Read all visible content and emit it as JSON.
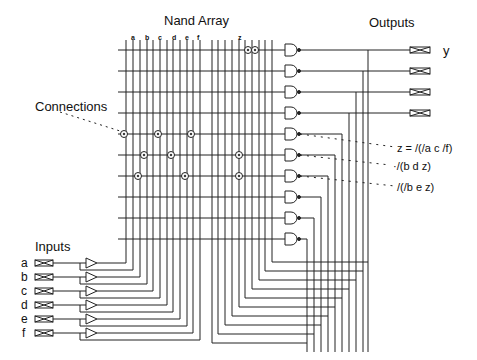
{
  "diagram": {
    "title": "Nand Array",
    "outputs_label": "Outputs",
    "inputs_label": "Inputs",
    "connections_label": "Connections",
    "column_labels": [
      "a",
      "b",
      "c",
      "d",
      "e",
      "f"
    ],
    "feedback_column_label": "z",
    "output_name": "y",
    "inputs": [
      "a",
      "b",
      "c",
      "d",
      "e",
      "f"
    ],
    "equations": [
      "z = /(/a c /f)",
      "·/(b d z)",
      "/(/b e z)"
    ],
    "gate_count": 10,
    "output_pad_count": 4,
    "colors": {
      "line": "#222222",
      "background": "#ffffff"
    }
  }
}
